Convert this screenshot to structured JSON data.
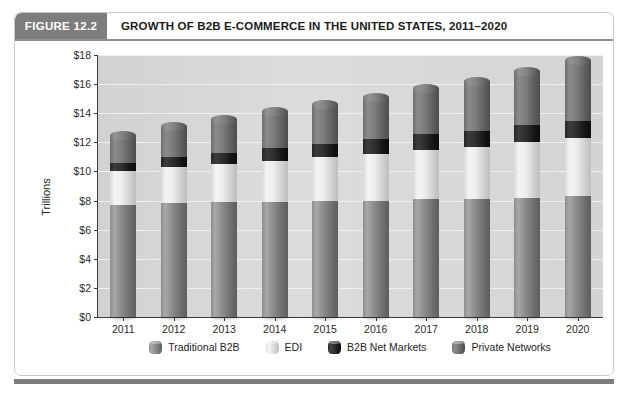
{
  "figure": {
    "tag": "FIGURE 12.2",
    "title": "GROWTH OF B2B E-COMMERCE IN THE UNITED STATES, 2011–2020"
  },
  "footnote": "",
  "colors": {
    "traditional_b2b": "#8a8a8a",
    "edi": "#ededed",
    "b2b_net_markets": "#1f1f1f",
    "private_networks": "#767676",
    "plot_background": "#d7d7d7",
    "header_tag_background": "#7d7d7d",
    "axis": "#3a3a3a"
  },
  "chart_data": {
    "type": "bar",
    "stacked": true,
    "title": "GROWTH OF B2B E-COMMERCE IN THE UNITED STATES, 2011–2020",
    "xlabel": "",
    "ylabel": "Trillions",
    "ylim": [
      0,
      18
    ],
    "ytick_labels": [
      "$0",
      "$2",
      "$4",
      "$6",
      "$8",
      "$10",
      "$12",
      "$14",
      "$16",
      "$18"
    ],
    "ytick_values": [
      0,
      2,
      4,
      6,
      8,
      10,
      12,
      14,
      16,
      18
    ],
    "grid": true,
    "legend_position": "bottom",
    "categories": [
      "2011",
      "2012",
      "2013",
      "2014",
      "2015",
      "2016",
      "2017",
      "2018",
      "2019",
      "2020"
    ],
    "series": [
      {
        "name": "Traditional B2B",
        "color": "#8a8a8a",
        "values": [
          7.7,
          7.8,
          7.9,
          7.9,
          8.0,
          8.0,
          8.1,
          8.1,
          8.2,
          8.3
        ]
      },
      {
        "name": "EDI",
        "color": "#ededed",
        "values": [
          2.3,
          2.5,
          2.6,
          2.8,
          3.0,
          3.2,
          3.4,
          3.6,
          3.8,
          4.0
        ]
      },
      {
        "name": "B2B Net Markets",
        "color": "#1f1f1f",
        "values": [
          0.6,
          0.7,
          0.8,
          0.9,
          0.9,
          1.0,
          1.1,
          1.1,
          1.2,
          1.2
        ]
      },
      {
        "name": "Private Networks",
        "color": "#767676",
        "values": [
          1.9,
          2.1,
          2.3,
          2.5,
          2.7,
          2.9,
          3.1,
          3.4,
          3.7,
          4.1
        ]
      }
    ],
    "totals": [
      12.5,
      13.1,
      13.6,
      14.1,
      14.6,
      15.1,
      15.7,
      16.2,
      16.9,
      17.6
    ]
  }
}
